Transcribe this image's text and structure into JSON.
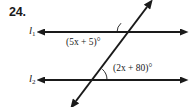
{
  "problem": {
    "number": "24."
  },
  "figure": {
    "type": "parallel-lines-transversal",
    "stroke_color": "#1a1a1a",
    "background_color": "#ffffff",
    "lines": [
      {
        "id": "line-1",
        "name": "l",
        "subscript": "1",
        "orientation": "horizontal",
        "arrowheads": "both",
        "x1": 44,
        "y1": 32,
        "x2": 181,
        "y2": 32
      },
      {
        "id": "line-2",
        "name": "l",
        "subscript": "2",
        "orientation": "horizontal",
        "arrowheads": "both",
        "x1": 44,
        "y1": 80,
        "x2": 181,
        "y2": 80
      },
      {
        "id": "transversal",
        "name": "transversal",
        "orientation": "oblique",
        "arrowheads": "both",
        "x1": 75,
        "y1": 102,
        "x2": 148,
        "y2": 6
      }
    ],
    "intersections": [
      {
        "id": "upper-intersection",
        "x": 129,
        "y": 32
      },
      {
        "id": "lower-intersection",
        "x": 93,
        "y": 80
      }
    ],
    "angles": [
      {
        "id": "angle-1",
        "label": "(5x + 5)°",
        "expression": "5x + 5",
        "at": "upper-intersection",
        "position": "below-left",
        "arc": true
      },
      {
        "id": "angle-2",
        "label": "(2x + 80)°",
        "expression": "2x + 80",
        "at": "lower-intersection",
        "position": "above-right",
        "arc": true
      }
    ]
  }
}
